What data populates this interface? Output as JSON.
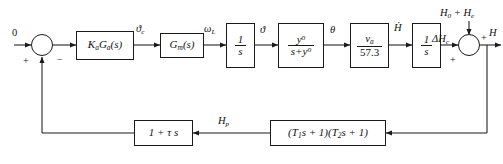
{
  "diagram": {
    "type": "control-system-block-diagram",
    "line_color": "#1a1a1a",
    "background": "#ffffff"
  },
  "inputs": {
    "reference": "0",
    "disturbance": "H₀ + Hₑ"
  },
  "output": {
    "label": "H"
  },
  "summing_junctions": [
    {
      "name": "error-summing-junction",
      "signs": {
        "left": "+",
        "bottom_left": "+",
        "bottom_right": "−"
      }
    },
    {
      "name": "output-summing-junction",
      "signs": {
        "left": "+",
        "right": "+"
      }
    }
  ],
  "forward_blocks": [
    {
      "name": "controller-block",
      "label": "KaGa(s)",
      "num": "",
      "den": ""
    },
    {
      "name": "actuator-block",
      "label": "Gm(s)",
      "num": "",
      "den": ""
    },
    {
      "name": "integrator-1-block",
      "label": "1/s",
      "num": "1",
      "den": "s"
    },
    {
      "name": "lag-block",
      "label": "y°/(s+y°)",
      "num": "y°",
      "den": "s+y°"
    },
    {
      "name": "gain-block",
      "label": "va/57.3",
      "num": "va",
      "den": "57.3"
    },
    {
      "name": "integrator-2-block",
      "label": "1/s",
      "num": "1",
      "den": "s"
    }
  ],
  "feedback_blocks": [
    {
      "name": "lead-compensator-block",
      "label": "1 + τ s"
    },
    {
      "name": "sensor-dynamics-block",
      "label": "(T₁s + 1)(T₂s + 1)"
    }
  ],
  "signals": {
    "reference_input": "0",
    "controller_output": "ϑc",
    "actuator_output": "ωL",
    "integrator1_output": "ϑ",
    "lag_output": "θ",
    "gain_output": "Ḣ",
    "integrator2_output": "ΔHc",
    "feedback_mid": "Hp",
    "plant_output": "H"
  }
}
